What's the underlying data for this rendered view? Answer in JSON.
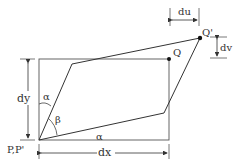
{
  "diagram": {
    "labels": {
      "du": "du",
      "dv": "dv",
      "dx": "dx",
      "dy": "dy",
      "q": "Q",
      "q_prime": "Q'",
      "p": "P,P'",
      "alpha_top": "α",
      "alpha_bottom": "α",
      "beta": "β"
    },
    "colors": {
      "stroke": "#444444",
      "text": "#333333",
      "background": "#ffffff"
    }
  }
}
